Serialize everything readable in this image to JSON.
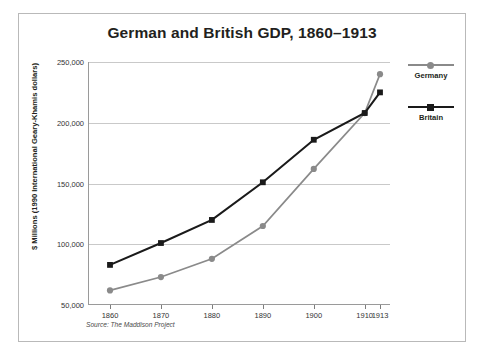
{
  "chart_data": {
    "type": "line",
    "title": "German and British GDP, 1860–1913",
    "xlabel": "",
    "ylabel": "$ Millions (1990 International Geary-Khamis dollars)",
    "source": "Source: The Maddison Project",
    "x": [
      1860,
      1870,
      1880,
      1890,
      1900,
      1910,
      1913
    ],
    "xticklabels": [
      "1860",
      "1870",
      "1880",
      "1890",
      "1900",
      "1910",
      "1913"
    ],
    "yticklabels": [
      "250,000",
      "200,000",
      "150,000",
      "100,000",
      "50,000"
    ],
    "yticks": [
      250000,
      200000,
      150000,
      100000,
      50000
    ],
    "ylim": [
      50000,
      250000
    ],
    "grid": "horizontal",
    "legend_position": "right",
    "series": [
      {
        "name": "Germany",
        "color": "#8a8a8a",
        "marker": "circle",
        "values": [
          62000,
          73000,
          88000,
          115000,
          162000,
          208000,
          240000
        ]
      },
      {
        "name": "Britain",
        "color": "#1a1a1a",
        "marker": "square",
        "values": [
          83000,
          101000,
          120000,
          151000,
          186000,
          208000,
          225000
        ]
      }
    ]
  },
  "legend": {
    "items": [
      {
        "label": "Germany"
      },
      {
        "label": "Britain"
      }
    ]
  }
}
